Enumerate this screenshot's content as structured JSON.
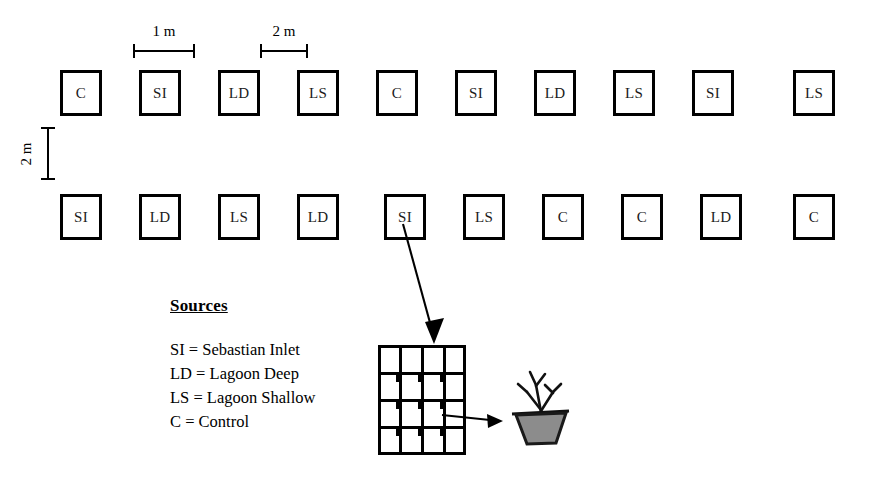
{
  "figure": {
    "background_color": "#ffffff",
    "line_color": "#000000"
  },
  "dimensions": [
    {
      "id": "plot-width",
      "label": "1 m",
      "orientation": "horizontal"
    },
    {
      "id": "plot-gap",
      "label": "2 m",
      "orientation": "horizontal"
    },
    {
      "id": "row-gap",
      "label": "2 m",
      "orientation": "vertical"
    }
  ],
  "plot_rows": [
    {
      "row_id": "top-row",
      "plots": [
        "C",
        "SI",
        "LD",
        "LS",
        "C",
        "SI",
        "LD",
        "LS",
        "SI",
        "LS"
      ]
    },
    {
      "row_id": "bottom-row",
      "plots": [
        "SI",
        "LD",
        "LS",
        "LD",
        "SI",
        "LS",
        "C",
        "C",
        "LD",
        "C"
      ]
    }
  ],
  "callout": {
    "source_plot_row": "bottom-row",
    "source_plot_index": 4,
    "source_plot_label": "SI"
  },
  "legend": {
    "title": "Sources",
    "entries": [
      {
        "code": "SI",
        "text": "SI = Sebastian Inlet"
      },
      {
        "code": "LD",
        "text": "LD = Lagoon Deep"
      },
      {
        "code": "LS",
        "text": "LS = Lagoon Shallow"
      },
      {
        "code": "C",
        "text": "C = Control"
      }
    ]
  },
  "detail": {
    "tray": {
      "rows": 4,
      "columns": 4,
      "description": "4 by 4 planting unit grid"
    },
    "pot": {
      "description": "seagrass planting pot",
      "fill_color": "#8c8c8c",
      "rim_color": "#1a1a1a"
    }
  }
}
